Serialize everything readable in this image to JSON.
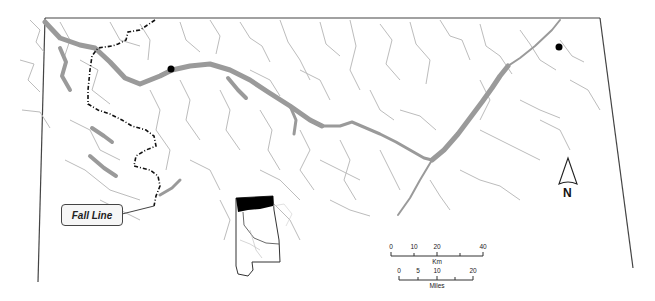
{
  "map": {
    "colors": {
      "background": "#ffffff",
      "border": "#444444",
      "reservoir": "#9a9a9a",
      "streams": "#b8b8b8",
      "fall_line": "#111111",
      "city_point": "#000000"
    },
    "annotations": {
      "fall_line_label": "Fall Line",
      "north_label": "N"
    },
    "scale_km": {
      "unit": "Km",
      "ticks": [
        "0",
        "10",
        "20",
        "40"
      ]
    },
    "scale_miles": {
      "unit": "Miles",
      "ticks": [
        "0",
        "5",
        "10",
        "20"
      ]
    },
    "inset": {
      "description": "Alabama state outline with northern highlighted region"
    }
  }
}
